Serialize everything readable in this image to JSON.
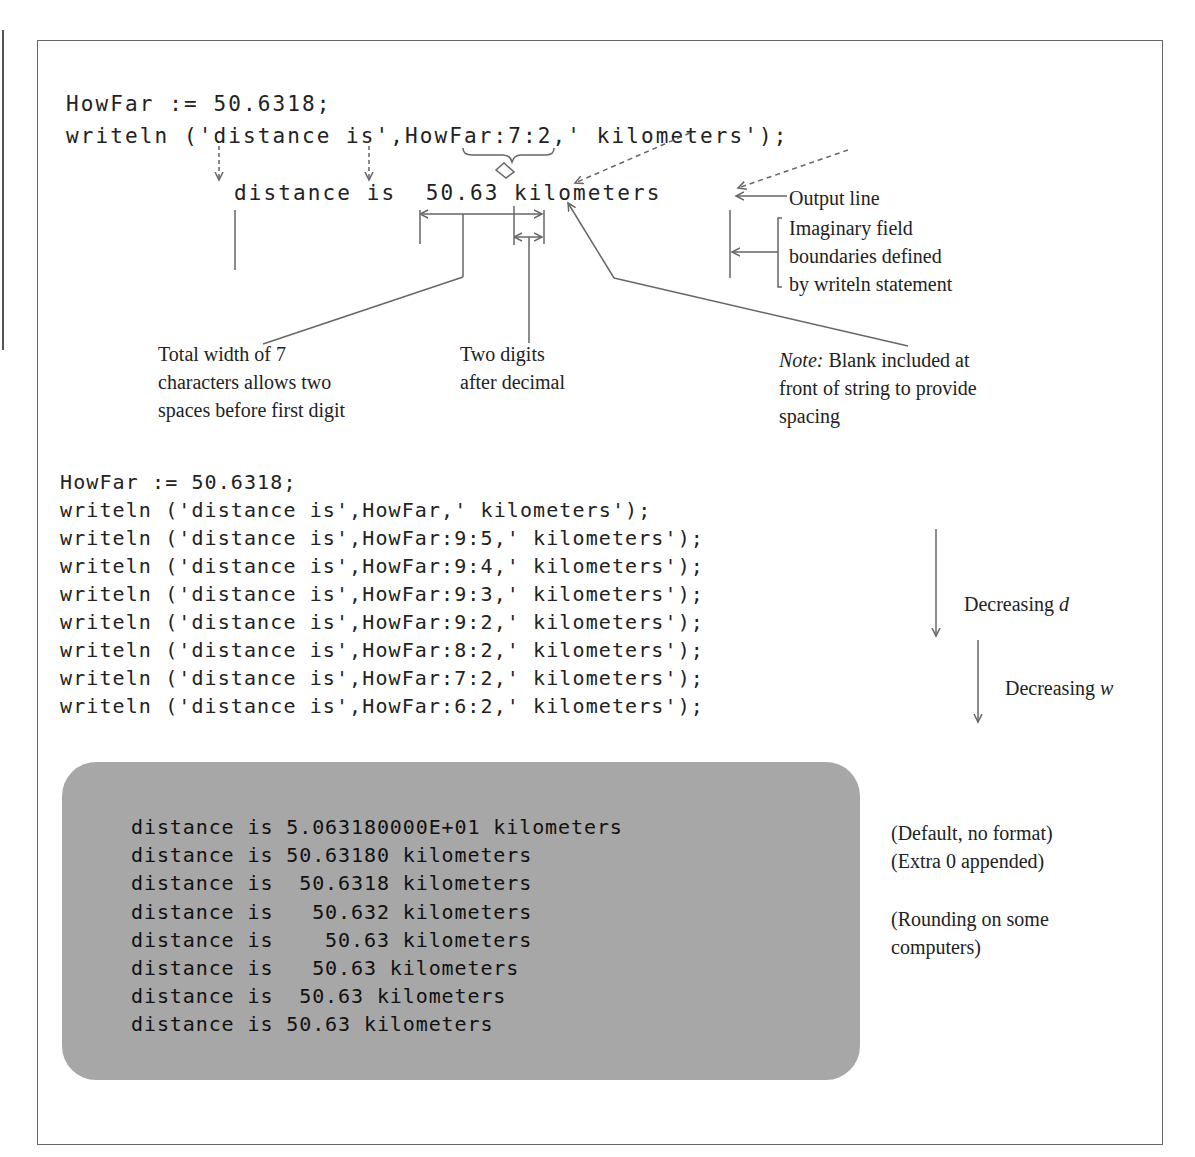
{
  "top_example": {
    "assignment": "HowFar := 50.6318;",
    "statement": "writeln ('distance is',HowFar:7:2,' kilometers');",
    "output_line": "distance is  50.63 kilometers",
    "labels": {
      "output_line": "Output line",
      "field_boundaries": [
        "Imaginary field",
        "boundaries defined",
        "by writeln statement"
      ],
      "total_width": [
        "Total width of 7",
        "characters allows two",
        "spaces before first digit"
      ],
      "two_digits": [
        "Two digits",
        "after decimal"
      ],
      "note_prefix": "Note:",
      "note": [
        " Blank included at",
        "front of string to provide",
        "spacing"
      ]
    }
  },
  "code_listing": [
    "HowFar := 50.6318;",
    "writeln ('distance is',HowFar,' kilometers');",
    "writeln ('distance is',HowFar:9:5,' kilometers');",
    "writeln ('distance is',HowFar:9:4,' kilometers');",
    "writeln ('distance is',HowFar:9:3,' kilometers');",
    "writeln ('distance is',HowFar:9:2,' kilometers');",
    "writeln ('distance is',HowFar:8:2,' kilometers');",
    "writeln ('distance is',HowFar:7:2,' kilometers');",
    "writeln ('distance is',HowFar:6:2,' kilometers');"
  ],
  "side_labels": {
    "decreasing_d": "Decreasing",
    "decreasing_d_var": "d",
    "decreasing_w": "Decreasing",
    "decreasing_w_var": "w"
  },
  "screen_output": [
    "distance is 5.063180000E+01 kilometers",
    "distance is 50.63180 kilometers",
    "distance is  50.6318 kilometers",
    "distance is   50.632 kilometers",
    "distance is    50.63 kilometers",
    "distance is   50.63 kilometers",
    "distance is  50.63 kilometers",
    "distance is 50.63 kilometers"
  ],
  "screen_notes": {
    "default": "(Default, no format)",
    "extra_zero": "(Extra 0 appended)",
    "rounding": [
      "(Rounding on some",
      "computers)"
    ]
  },
  "colors": {
    "screen_gray": "#a7a7a7",
    "ink": "#222222",
    "line": "#666666"
  }
}
